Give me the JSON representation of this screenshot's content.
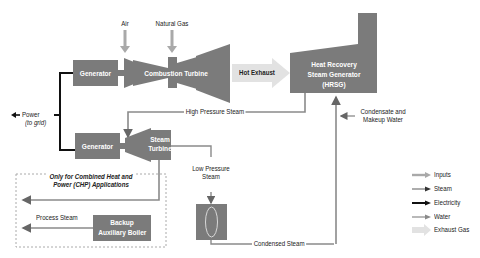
{
  "components": {
    "generator_top": "Generator",
    "combustion_turbine": "Combustion Turbine",
    "hrsg": [
      "Heat Recovery",
      "Steam Generator",
      "(HRSG)"
    ],
    "generator_bottom": "Generator",
    "steam_turbine": [
      "Steam",
      "Turbine"
    ],
    "backup_boiler": [
      "Backup",
      "Auxiliary Boiler"
    ]
  },
  "flows": {
    "air": "Air",
    "natural_gas": "Natural Gas",
    "hot_exhaust": "Hot Exhaust",
    "power": "Power",
    "power_sub": "(to grid)",
    "high_pressure_steam": "High Pressure Steam",
    "condensate": [
      "Condensate and",
      "Makeup Water"
    ],
    "low_pressure_steam": [
      "Low Pressure",
      "Steam"
    ],
    "condensed_steam": "Condensed Steam",
    "process_steam": "Process Steam"
  },
  "chp_note": [
    "Only for Combined  Heat and",
    "Power (CHP) Applications"
  ],
  "legend": [
    {
      "label": "Inputs",
      "color": "#a9a9a9"
    },
    {
      "label": "Steam",
      "color": "#8a8a8a"
    },
    {
      "label": "Electricity",
      "color": "#000000"
    },
    {
      "label": "Water",
      "color": "#8a8a8a"
    },
    {
      "label": "Exhaust Gas",
      "color": "#e2e2e2"
    }
  ],
  "colors": {
    "component": "#7b7b7b",
    "line": "#8a8a8a",
    "electric": "#111111"
  }
}
